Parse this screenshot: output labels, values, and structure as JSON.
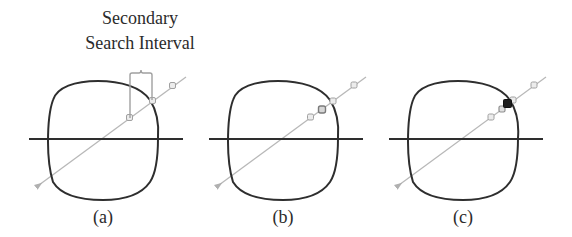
{
  "figure": {
    "annotation": {
      "line1": "Secondary",
      "line2": "Search Interval"
    },
    "panels": [
      {
        "id": "a",
        "label": "(a)",
        "offset_x": 0,
        "sample_points": [
          "open",
          "open",
          "open"
        ],
        "bracket": true,
        "hit_point": false
      },
      {
        "id": "b",
        "label": "(b)",
        "offset_x": 180,
        "sample_points": [
          "open",
          "emphasized",
          "open",
          "open"
        ],
        "bracket": false,
        "hit_point": false
      },
      {
        "id": "c",
        "label": "(c)",
        "offset_x": 360,
        "sample_points": [
          "open",
          "open",
          "filled",
          "open",
          "open"
        ],
        "bracket": false,
        "hit_point": true
      }
    ],
    "colors": {
      "outline": "#2e2e2e",
      "horizon": "#2e2e2e",
      "ray": "#b5b5b5",
      "sample_open": "#a8a8a8",
      "sample_emphasized": "#8a8a8a",
      "sample_filled": "#1e1e1e",
      "bracket": "#a0a0a0",
      "text": "#2b2b2b"
    }
  }
}
